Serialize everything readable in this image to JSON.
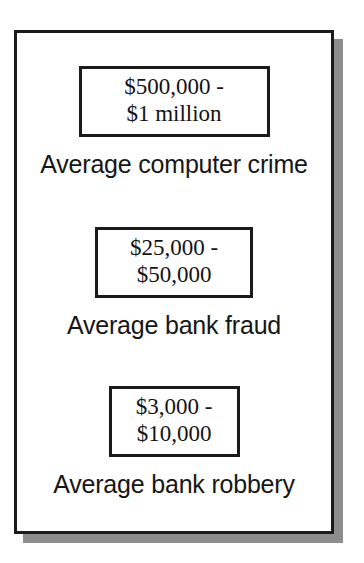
{
  "figure": {
    "name": "crime-value-comparison-diagram",
    "frame": {
      "border_color": "#1b1b1b",
      "shadow_color": "#8d8d8d",
      "background_color": "#ffffff"
    },
    "groups": [
      {
        "id": "average-computer-crime",
        "value_lines": [
          "$500,000 -",
          "$1 million"
        ],
        "caption": "Average computer crime"
      },
      {
        "id": "average-bank-fraud",
        "value_lines": [
          "$25,000 -",
          "$50,000"
        ],
        "caption": "Average bank fraud"
      },
      {
        "id": "average-bank-robbery",
        "value_lines": [
          "$3,000 -",
          "$10,000"
        ],
        "caption": "Average bank robbery"
      }
    ]
  },
  "chart_data": {
    "type": "table",
    "title": "",
    "categories": [
      "Average computer crime",
      "Average bank fraud",
      "Average bank robbery"
    ],
    "values_text": [
      "$500,000 - $1 million",
      "$25,000 - $50,000",
      "$3,000 - $10,000"
    ],
    "ranges_low": [
      500000,
      25000,
      3000
    ],
    "ranges_high": [
      1000000,
      50000,
      10000
    ],
    "unit": "USD",
    "xlabel": "",
    "ylabel": "",
    "legend": [],
    "grid": false
  }
}
